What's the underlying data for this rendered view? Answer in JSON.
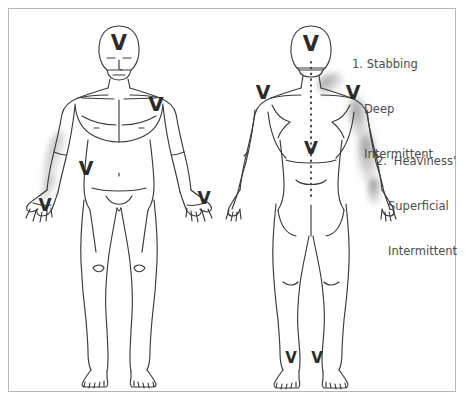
{
  "figure": {
    "title_present": false,
    "background_color": "#ffffff",
    "border_color": "#b6b6b6",
    "outline_color": "#3a3a3a",
    "marker_color": "#2b2b2b",
    "shading_color": "#8a8a8a",
    "text_color": "#4c4c4c"
  },
  "annotations": [
    {
      "id": "annotation-1",
      "number": "1.",
      "quality": "Stabbing",
      "depth": "Deep",
      "frequency": "Intermittent",
      "line1": "1. Stabbing",
      "line2": "Deep",
      "line3": "Intermittent"
    },
    {
      "id": "annotation-2",
      "number": "2.",
      "quality": "'Heaviness'",
      "depth": "Superficial",
      "frequency": "Intermittent",
      "line1": "2. 'Heaviness'",
      "line2": "Superficial",
      "line3": "Intermittent"
    }
  ],
  "views": [
    {
      "name": "anterior",
      "label": "Front view body diagram",
      "markers": [
        {
          "name": "v-marker-front-forehead",
          "region": "forehead",
          "x": 119,
          "y": 42
        },
        {
          "name": "v-marker-front-left-shoulder",
          "region": "left shoulder / upper chest",
          "x": 155,
          "y": 103
        },
        {
          "name": "v-marker-front-abdomen",
          "region": "right lower abdomen",
          "x": 85,
          "y": 167
        },
        {
          "name": "v-marker-front-right-hand",
          "region": "right hand",
          "x": 45,
          "y": 203
        },
        {
          "name": "v-marker-front-left-hand",
          "region": "left hand",
          "x": 203,
          "y": 196
        }
      ],
      "shaded_regions": [
        {
          "name": "shading-front-right-forearm",
          "region": "right forearm"
        }
      ]
    },
    {
      "name": "posterior",
      "label": "Back view body diagram",
      "markers": [
        {
          "name": "v-marker-back-occiput",
          "region": "back of head",
          "x": 311,
          "y": 43
        },
        {
          "name": "v-marker-back-right-shoulder",
          "region": "right shoulder",
          "x": 263,
          "y": 91
        },
        {
          "name": "v-marker-back-left-shoulder",
          "region": "left shoulder",
          "x": 353,
          "y": 91
        },
        {
          "name": "v-marker-back-midback",
          "region": "mid back / thoracic spine",
          "x": 311,
          "y": 146
        },
        {
          "name": "v-marker-back-right-heel",
          "region": "right heel",
          "x": 291,
          "y": 357
        },
        {
          "name": "v-marker-back-left-heel",
          "region": "left heel",
          "x": 317,
          "y": 357
        }
      ],
      "shaded_regions": [
        {
          "name": "shading-back-left-trapezius",
          "region": "left trapezius / upper shoulder"
        },
        {
          "name": "shading-back-left-arm",
          "region": "left upper arm and forearm"
        }
      ],
      "spine_line": {
        "name": "spine-dotted-line",
        "style": "dotted",
        "from_y": 62,
        "to_y": 200
      }
    }
  ]
}
